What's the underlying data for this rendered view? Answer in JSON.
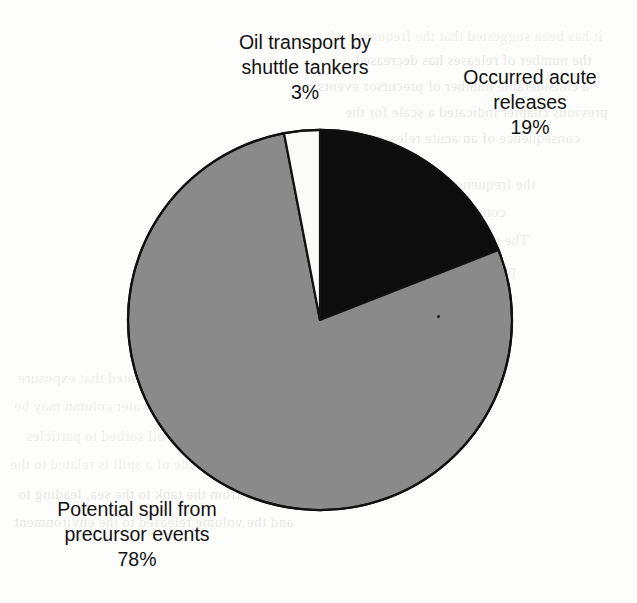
{
  "page": {
    "background_color": "#fdfdfb",
    "ghost_text_color": "#5a5c64",
    "ghost_lines": [
      "it has been suggested that the frequency of",
      "the number of releases has decreased",
      "a considerable number of precursor events",
      "previous chapter indicated a scale for the",
      "consequence of an acute release from a",
      "the frequency of occurrence of the w",
      "consequences of an acute spill",
      "The risk is thus a combination of",
      "precursor events and the acute",
      "releases",
      "In addition, it should be noted that exposure",
      "contaminants in the water column may be",
      "availability of oil sorbed to particles",
      "The magnitude of a spill is related to the",
      "the spill from the tank to the sea, leading to",
      "and the volume released to the environment"
    ]
  },
  "chart_data": {
    "type": "pie",
    "title": "",
    "legend_position": "labels-outside",
    "center": {
      "x": 320,
      "y": 320
    },
    "radius": 192,
    "start_angle_deg": 0,
    "direction": "clockwise",
    "stroke_color": "#111111",
    "stroke_width": 2.2,
    "slices": [
      {
        "label": "Occurred acute releases",
        "value": 19,
        "value_label": "19%",
        "color": "#0d0d0d",
        "label_position": "right"
      },
      {
        "label": "Potential spill from precursor events",
        "value": 78,
        "value_label": "78%",
        "color": "#8a8a8a",
        "label_position": "bottom-left"
      },
      {
        "label": "Oil transport by shuttle tankers",
        "value": 3,
        "value_label": "3%",
        "color": "#fbfbf9",
        "label_position": "top"
      }
    ]
  },
  "labels": {
    "shuttle": {
      "line1": "Oil transport by",
      "line2": "shuttle tankers",
      "percent": "3%"
    },
    "acute": {
      "line1": "Occurred acute",
      "line2": "releases",
      "percent": "19%"
    },
    "precursor": {
      "line1": "Potential spill from",
      "line2": "precursor events",
      "percent": "78%"
    }
  }
}
